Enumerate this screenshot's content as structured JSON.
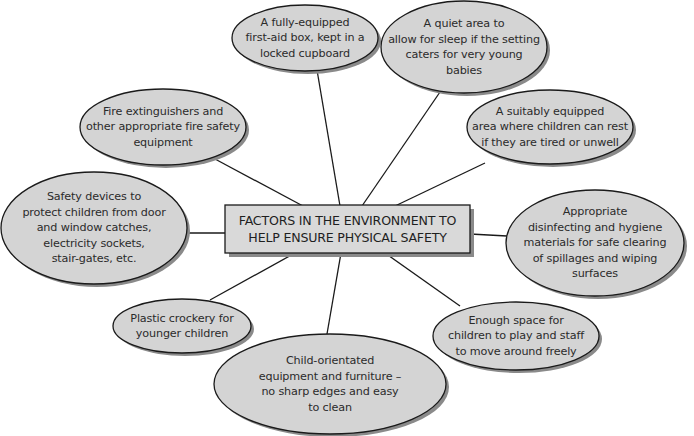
{
  "diagram": {
    "type": "mind-map",
    "center": {
      "label": "FACTORS IN THE ENVIRONMENT TO HELP ENSURE PHYSICAL SAFETY",
      "line1": "FACTORS IN THE ENVIRONMENT TO",
      "line2": "HELP ENSURE PHYSICAL SAFETY"
    },
    "colors": {
      "node_fill": "#d4d4d4",
      "center_fill": "#d9d9d9",
      "stroke": "#1a1a1a",
      "shadow": "#8a8a8a",
      "text": "#2b2b2b"
    },
    "nodes": [
      {
        "id": "first-aid",
        "lines": [
          "A fully-equipped",
          "first-aid box, kept in a",
          "locked cupboard"
        ]
      },
      {
        "id": "quiet-area",
        "lines": [
          "A quiet area to",
          "allow for sleep if the setting",
          "caters for very young",
          "babies"
        ]
      },
      {
        "id": "rest-area",
        "lines": [
          "A suitably equipped",
          "area where children can rest",
          "if they are tired or unwell"
        ]
      },
      {
        "id": "fire-safety",
        "lines": [
          "Fire extinguishers and",
          "other appropriate fire safety",
          "equipment"
        ]
      },
      {
        "id": "safety-devices",
        "lines": [
          "Safety devices to",
          "protect children from door",
          "and window catches,",
          "electricity sockets,",
          "stair-gates, etc."
        ]
      },
      {
        "id": "hygiene",
        "lines": [
          "Appropriate",
          "disinfecting and hygiene",
          "materials for safe clearing",
          "of spillages and wiping",
          "surfaces"
        ]
      },
      {
        "id": "crockery",
        "lines": [
          "Plastic crockery for",
          "younger children"
        ]
      },
      {
        "id": "space",
        "lines": [
          "Enough space for",
          "children to play and staff",
          "to move around freely"
        ]
      },
      {
        "id": "furniture",
        "lines": [
          "Child-orientated",
          "equipment and furniture –",
          "no sharp edges and easy",
          "to clean"
        ]
      }
    ]
  }
}
